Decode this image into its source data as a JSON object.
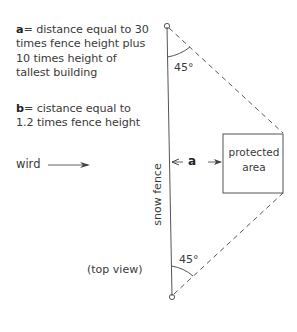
{
  "legend": {
    "a_key": "a",
    "a_text": "= distance equal to 30 times fence height plus 10 times height of tallest building",
    "b_key": "b",
    "b_text": "= cistance equal to 1.2 times fence height"
  },
  "labels": {
    "wind": "wird",
    "snow_fence": "snow fence",
    "top_view": "(top view)",
    "angle_top": "45°",
    "angle_bottom": "45°",
    "distance_a": "a",
    "protected_line1": "protected",
    "protected_line2": "area"
  },
  "colors": {
    "line": "#555555",
    "text": "#3a3a3a"
  }
}
